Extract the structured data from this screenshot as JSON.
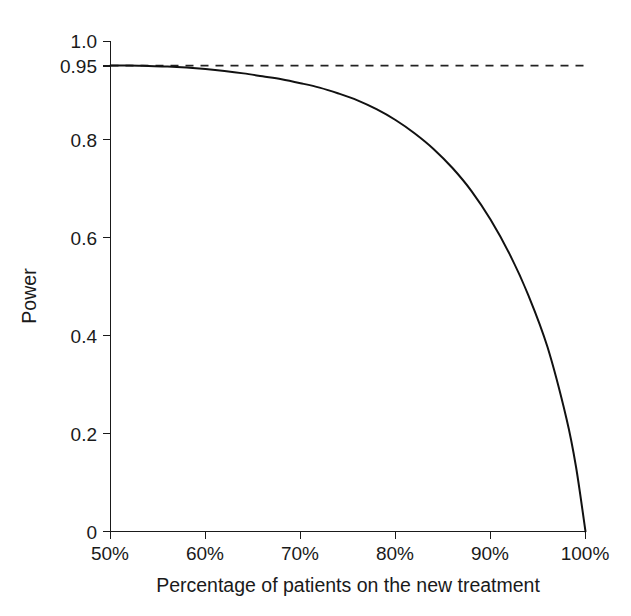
{
  "chart_data": {
    "type": "line",
    "title": "",
    "subtitle": "",
    "xlabel": "Percentage of patients on the new treatment",
    "ylabel": "Power",
    "xlim": [
      50,
      100
    ],
    "ylim": [
      0,
      1.0
    ],
    "grid": false,
    "legend": null,
    "x_tick_labels": [
      "50%",
      "60%",
      "70%",
      "80%",
      "90%",
      "100%"
    ],
    "x_tick_values": [
      50,
      60,
      70,
      80,
      90,
      100
    ],
    "y_tick_labels": [
      "1.0",
      "0.95",
      "0.8",
      "0.6",
      "0.4",
      "0.2",
      "0"
    ],
    "y_tick_values": [
      1.0,
      0.95,
      0.8,
      0.6,
      0.4,
      0.2,
      0
    ],
    "series": [
      {
        "name": "Power curve",
        "style": "solid",
        "color": "#111111",
        "x": [
          50,
          52,
          54,
          56,
          58,
          60,
          62,
          64,
          66,
          68,
          70,
          72,
          74,
          76,
          78,
          80,
          82,
          84,
          86,
          88,
          90,
          92,
          94,
          96,
          98,
          99,
          100
        ],
        "values": [
          0.95,
          0.95,
          0.949,
          0.948,
          0.946,
          0.943,
          0.939,
          0.934,
          0.928,
          0.922,
          0.914,
          0.905,
          0.893,
          0.879,
          0.861,
          0.839,
          0.812,
          0.78,
          0.741,
          0.694,
          0.636,
          0.566,
          0.481,
          0.376,
          0.23,
          0.132,
          0.0
        ]
      },
      {
        "name": "Nominal power reference",
        "style": "dashed",
        "color": "#222222",
        "x": [
          50,
          100
        ],
        "values": [
          0.95,
          0.95
        ]
      }
    ]
  }
}
